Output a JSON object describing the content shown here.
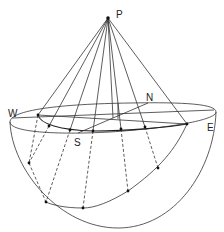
{
  "figure": {
    "type": "geometric-projection-diagram",
    "labels": {
      "P": "P",
      "N": "N",
      "S": "S",
      "E": "E",
      "W": "W"
    },
    "colors": {
      "stroke": "#333333",
      "background": "#ffffff"
    }
  },
  "geometry": {
    "apex": {
      "x": 108,
      "y": 18
    },
    "rim_points": [
      {
        "x": 38,
        "y": 115
      },
      {
        "x": 49,
        "y": 126
      },
      {
        "x": 70,
        "y": 130
      },
      {
        "x": 93,
        "y": 131
      },
      {
        "x": 121,
        "y": 129
      },
      {
        "x": 145,
        "y": 127
      },
      {
        "x": 187,
        "y": 124
      }
    ],
    "bowl_points": [
      {
        "x": 29,
        "y": 163
      },
      {
        "x": 46,
        "y": 202
      },
      {
        "x": 83,
        "y": 208
      },
      {
        "x": 128,
        "y": 191
      },
      {
        "x": 158,
        "y": 168
      }
    ]
  }
}
